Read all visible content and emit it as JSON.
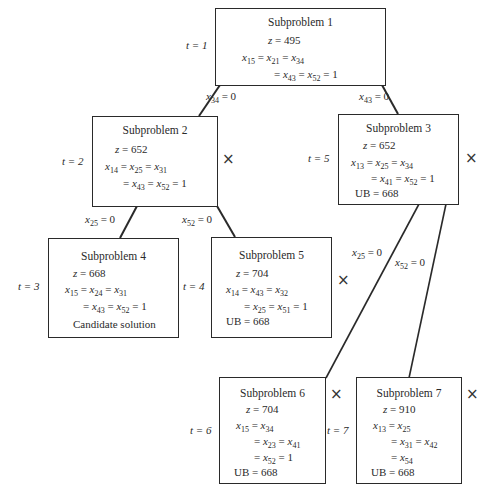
{
  "nodes": [
    {
      "id": 1,
      "title": "Subproblem 1",
      "t": "t = 1",
      "z": "z = 495",
      "lines": [
        "x15 = x21 = x34",
        "= x43 = x52 = 1"
      ],
      "ub": null,
      "note": null,
      "fathomed": false
    },
    {
      "id": 2,
      "title": "Subproblem 2",
      "t": "t = 2",
      "z": "z = 652",
      "lines": [
        "x14 = x25 = x31",
        "= x43 = x52 = 1"
      ],
      "ub": null,
      "note": null,
      "fathomed": true
    },
    {
      "id": 3,
      "title": "Subproblem 3",
      "t": "t = 5",
      "z": "z = 652",
      "lines": [
        "x13 = x25 = x34",
        "= x41 = x52 = 1"
      ],
      "ub": "UB = 668",
      "note": null,
      "fathomed": true
    },
    {
      "id": 4,
      "title": "Subproblem 4",
      "t": "t = 3",
      "z": "z = 668",
      "lines": [
        "x15 = x24 = x31",
        "= x43 = x52 = 1"
      ],
      "ub": null,
      "note": "Candidate solution",
      "fathomed": false
    },
    {
      "id": 5,
      "title": "Subproblem 5",
      "t": "t = 4",
      "z": "z = 704",
      "lines": [
        "x14 = x43 = x32",
        "= x25 = x51 = 1"
      ],
      "ub": "UB = 668",
      "note": null,
      "fathomed": true
    },
    {
      "id": 6,
      "title": "Subproblem 6",
      "t": "t = 6",
      "z": "z = 704",
      "lines": [
        "x15 = x34",
        "= x23 = x41",
        "= x52 = 1"
      ],
      "ub": "UB = 668",
      "note": null,
      "fathomed": true
    },
    {
      "id": 7,
      "title": "Subproblem 7",
      "t": "t = 7",
      "z": "z = 910",
      "lines": [
        "x13 = x25",
        "= x31 = x42",
        "= x54"
      ],
      "ub": "UB = 668",
      "note": null,
      "fathomed": true
    }
  ],
  "edges": [
    {
      "from": 1,
      "to": 2,
      "label": "x34 = 0"
    },
    {
      "from": 1,
      "to": 3,
      "label": "x43 = 0"
    },
    {
      "from": 2,
      "to": 4,
      "label": "x25 = 0"
    },
    {
      "from": 2,
      "to": 5,
      "label": "x52 = 0"
    },
    {
      "from": 3,
      "to": 6,
      "label": "x25 = 0"
    },
    {
      "from": 3,
      "to": 7,
      "label": "x52 = 0"
    }
  ],
  "fathom_mark": "×"
}
